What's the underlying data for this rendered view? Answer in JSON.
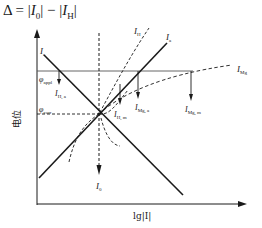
{
  "formula": {
    "delta": "Δ = |",
    "i0": "I",
    "i0_sub": "0",
    "mid": "| − |",
    "ih": "I",
    "ih_sub": "H",
    "end": "|"
  },
  "axes": {
    "y_label": "电位",
    "x_label": "lg|I|"
  },
  "levels": {
    "phi_appl": {
      "symbol": "φ",
      "sub": "appl"
    },
    "phi_corr": {
      "symbol": "φ",
      "sub": "corr"
    }
  },
  "curves": {
    "Ic": {
      "symbol": "I",
      "sub": "c"
    },
    "Ia": {
      "symbol": "I",
      "sub": "a"
    },
    "IH": {
      "symbol": "I",
      "sub": "H"
    },
    "IMg": {
      "symbol": "I",
      "sub": "Mg"
    },
    "I0": {
      "symbol": "I",
      "sub": "0"
    }
  },
  "markers": {
    "IH_a": {
      "symbol": "I",
      "sub": "H, a"
    },
    "IH_m": {
      "symbol": "I",
      "sub": "H, m"
    },
    "IMg_a": {
      "symbol": "I",
      "sub": "Mg, a"
    },
    "IMg_m": {
      "symbol": "I",
      "sub": "Mg, m"
    }
  },
  "colors": {
    "ink": "#1a1a1a",
    "level_line": "#555555"
  }
}
